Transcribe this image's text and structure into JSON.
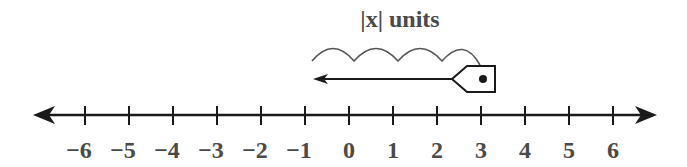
{
  "diagram": {
    "title_label": "|x| units",
    "number_line": {
      "min": -6,
      "max": 6,
      "tick_labels": [
        "−6",
        "−5",
        "−4",
        "−3",
        "−2",
        "−1",
        "0",
        "1",
        "2",
        "3",
        "4",
        "5",
        "6"
      ],
      "arrows": "both"
    },
    "pointer": {
      "position": 3,
      "direction": "left",
      "jumps": 4
    },
    "colors": {
      "line": "#1a1a1a",
      "text": "#4a4a4a",
      "arc": "#555555"
    }
  }
}
